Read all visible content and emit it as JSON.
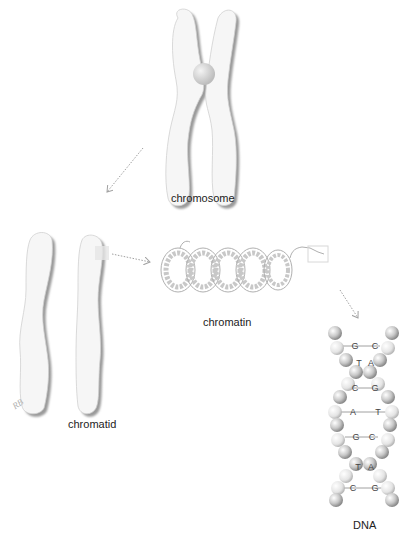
{
  "diagram": {
    "labels": {
      "chromosome": "chromosome",
      "chromatid": "chromatid",
      "chromatin": "chromatin",
      "dna": "DNA"
    },
    "signature": "RB",
    "dna_base_pairs": [
      {
        "left": "G",
        "right": "C"
      },
      {
        "left": "T",
        "right": "A"
      },
      {
        "left": "C",
        "right": "G"
      },
      {
        "left": "A",
        "right": "T"
      },
      {
        "left": "G",
        "right": "C"
      },
      {
        "left": "T",
        "right": "A"
      },
      {
        "left": "C",
        "right": "G"
      }
    ],
    "colors": {
      "background": "#ffffff",
      "structure_fill": "#f4f4f4",
      "shadow": "#9a9a9a",
      "arrow": "#a0a0a0",
      "text": "#222222"
    }
  }
}
